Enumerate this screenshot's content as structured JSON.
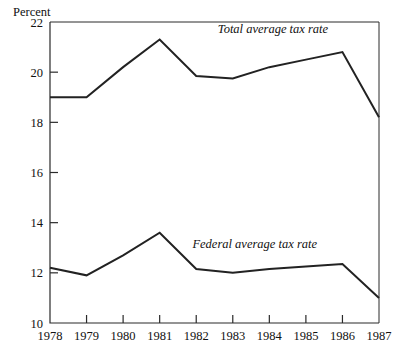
{
  "chart_data": {
    "type": "line",
    "title": "",
    "subtitle": "",
    "xlabel": "",
    "ylabel": "Percent",
    "ylim": [
      10,
      22
    ],
    "yticks": [
      10,
      12,
      14,
      16,
      18,
      20,
      22
    ],
    "ytick_labels": [
      "10",
      "12",
      "14",
      "16",
      "18",
      "20",
      "22"
    ],
    "grid": false,
    "legend_position": "inline-annotation",
    "x": [
      1978,
      1979,
      1980,
      1981,
      1982,
      1983,
      1984,
      1985,
      1986,
      1987
    ],
    "categories": [
      "1978",
      "1979",
      "1980",
      "1981",
      "1982",
      "1983",
      "1984",
      "1985",
      "1986",
      "1987"
    ],
    "series": [
      {
        "name": "Total average tax rate",
        "values": [
          19.0,
          19.0,
          20.2,
          21.3,
          19.85,
          19.75,
          20.2,
          20.5,
          20.8,
          18.2
        ]
      },
      {
        "name": "Federal average tax rate",
        "values": [
          12.2,
          11.9,
          12.7,
          13.6,
          12.15,
          12.0,
          12.15,
          12.25,
          12.35,
          11.0
        ]
      }
    ],
    "annotations": [
      {
        "text": "Total average tax rate",
        "x": 1984.1,
        "y": 21.55
      },
      {
        "text": "Federal average tax rate",
        "x": 1983.6,
        "y": 13.0
      }
    ],
    "colors": {
      "line": "#222222",
      "axis": "#2a2a2a",
      "background": "#ffffff",
      "text": "#111111"
    }
  }
}
